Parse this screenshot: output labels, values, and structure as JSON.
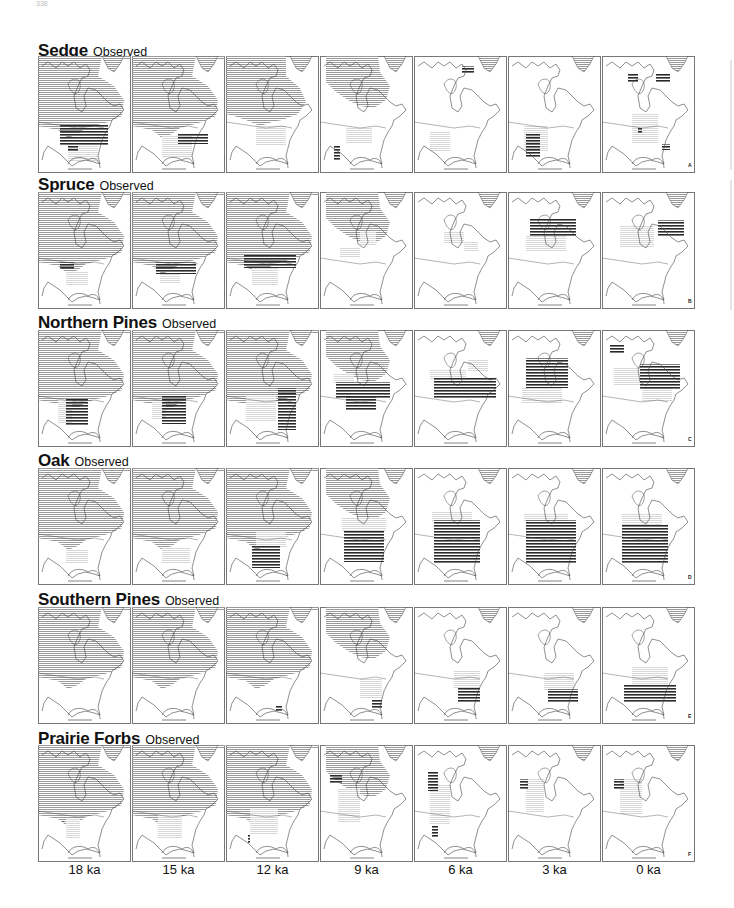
{
  "page_number": "338",
  "figure": {
    "observed_label": "Observed",
    "time_labels": [
      "18 ka",
      "15 ka",
      "12 ka",
      "9 ka",
      "6 ka",
      "3 ka",
      "0 ka"
    ],
    "colors": {
      "ice": "#9a9a9a",
      "dark": "#2a2a2a",
      "light": "#d8d8d8",
      "outline": "#444444",
      "frame": "#777777"
    },
    "rows": [
      {
        "taxon": "Sedge",
        "letter": "A",
        "panels": [
          {
            "ice": "full",
            "dark": [
              [
                22,
                68,
                48,
                22
              ],
              [
                30,
                90,
                10,
                6
              ]
            ],
            "light": [
              [
                30,
                90,
                30,
                16
              ]
            ]
          },
          {
            "ice": "full",
            "dark": [
              [
                46,
                78,
                30,
                10
              ]
            ],
            "light": [
              [
                30,
                80,
                30,
                22
              ]
            ]
          },
          {
            "ice": "mid",
            "dark": [],
            "light": [
              [
                30,
                70,
                30,
                20
              ]
            ]
          },
          {
            "ice": "small",
            "dark": [
              [
                14,
                90,
                6,
                14
              ]
            ],
            "light": [
              [
                26,
                72,
                26,
                16
              ]
            ]
          },
          {
            "ice": "none",
            "dark": [
              [
                48,
                10,
                12,
                8
              ]
            ],
            "light": [
              [
                16,
                75,
                20,
                20
              ]
            ]
          },
          {
            "ice": "none",
            "dark": [
              [
                18,
                78,
                14,
                24
              ]
            ],
            "light": [
              [
                16,
                70,
                24,
                26
              ]
            ]
          },
          {
            "ice": "none",
            "dark": [
              [
                26,
                18,
                10,
                8
              ],
              [
                54,
                18,
                14,
                8
              ],
              [
                36,
                72,
                4,
                6
              ],
              [
                60,
                88,
                8,
                6
              ]
            ],
            "light": [
              [
                30,
                58,
                26,
                30
              ]
            ]
          }
        ]
      },
      {
        "taxon": "Spruce",
        "letter": "B",
        "panels": [
          {
            "ice": "full",
            "dark": [
              [
                22,
                70,
                14,
                8
              ]
            ],
            "light": [
              [
                28,
                80,
                22,
                14
              ]
            ]
          },
          {
            "ice": "full",
            "dark": [
              [
                24,
                70,
                40,
                12
              ]
            ],
            "light": [
              [
                28,
                82,
                20,
                10
              ]
            ]
          },
          {
            "ice": "full",
            "dark": [
              [
                18,
                62,
                52,
                14
              ]
            ],
            "light": [
              [
                26,
                76,
                26,
                18
              ]
            ]
          },
          {
            "ice": "small",
            "dark": [],
            "light": [
              [
                40,
                40,
                16,
                14
              ],
              [
                20,
                55,
                20,
                10
              ]
            ]
          },
          {
            "ice": "none",
            "dark": [],
            "light": [
              [
                30,
                40,
                20,
                12
              ],
              [
                50,
                50,
                14,
                10
              ]
            ]
          },
          {
            "ice": "none",
            "dark": [
              [
                22,
                26,
                46,
                18
              ]
            ],
            "light": [
              [
                18,
                44,
                40,
                16
              ]
            ]
          },
          {
            "ice": "none",
            "dark": [
              [
                56,
                28,
                26,
                16
              ]
            ],
            "light": [
              [
                18,
                34,
                34,
                22
              ]
            ]
          }
        ]
      },
      {
        "taxon": "Northern Pines",
        "letter": "C",
        "panels": [
          {
            "ice": "full",
            "dark": [
              [
                28,
                68,
                22,
                28
              ]
            ],
            "light": [
              [
                20,
                70,
                14,
                24
              ]
            ]
          },
          {
            "ice": "full",
            "dark": [
              [
                30,
                66,
                24,
                28
              ]
            ],
            "light": [
              [
                20,
                72,
                14,
                18
              ]
            ]
          },
          {
            "ice": "full",
            "dark": [
              [
                52,
                58,
                18,
                42
              ]
            ],
            "light": [
              [
                20,
                66,
                30,
                26
              ]
            ]
          },
          {
            "ice": "small",
            "dark": [
              [
                16,
                52,
                54,
                16
              ],
              [
                26,
                66,
                30,
                14
              ]
            ],
            "light": [
              [
                14,
                44,
                20,
                10
              ]
            ]
          },
          {
            "ice": "none",
            "dark": [
              [
                20,
                48,
                62,
                20
              ]
            ],
            "light": [
              [
                16,
                40,
                36,
                10
              ],
              [
                54,
                30,
                20,
                12
              ]
            ]
          },
          {
            "ice": "none",
            "dark": [
              [
                18,
                28,
                42,
                30
              ]
            ],
            "light": [
              [
                14,
                58,
                40,
                16
              ]
            ]
          },
          {
            "ice": "none",
            "dark": [
              [
                38,
                34,
                40,
                26
              ],
              [
                8,
                14,
                14,
                10
              ]
            ],
            "light": [
              [
                12,
                38,
                26,
                18
              ],
              [
                40,
                58,
                30,
                14
              ]
            ]
          }
        ]
      },
      {
        "taxon": "Oak",
        "letter": "D",
        "panels": [
          {
            "ice": "full",
            "dark": [],
            "light": [
              [
                28,
                82,
                22,
                14
              ]
            ]
          },
          {
            "ice": "full",
            "dark": [],
            "light": [
              [
                30,
                80,
                28,
                16
              ]
            ]
          },
          {
            "ice": "full",
            "dark": [
              [
                26,
                78,
                28,
                22
              ]
            ],
            "light": [
              [
                30,
                64,
                30,
                16
              ]
            ]
          },
          {
            "ice": "small",
            "dark": [
              [
                24,
                62,
                40,
                32
              ]
            ],
            "light": [
              [
                22,
                50,
                44,
                14
              ]
            ]
          },
          {
            "ice": "none",
            "dark": [
              [
                20,
                52,
                46,
                44
              ]
            ],
            "light": [
              [
                18,
                44,
                40,
                10
              ]
            ]
          },
          {
            "ice": "none",
            "dark": [
              [
                18,
                52,
                50,
                44
              ]
            ],
            "light": [
              [
                16,
                46,
                44,
                8
              ]
            ]
          },
          {
            "ice": "none",
            "dark": [
              [
                20,
                56,
                46,
                40
              ]
            ],
            "light": [
              [
                20,
                46,
                40,
                12
              ]
            ]
          }
        ]
      },
      {
        "taxon": "Southern Pines",
        "letter": "E",
        "panels": [
          {
            "ice": "full",
            "dark": [],
            "light": []
          },
          {
            "ice": "full",
            "dark": [],
            "light": []
          },
          {
            "ice": "full",
            "dark": [
              [
                50,
                98,
                6,
                6
              ]
            ],
            "light": []
          },
          {
            "ice": "small",
            "dark": [
              [
                52,
                92,
                10,
                10
              ]
            ],
            "light": [
              [
                40,
                72,
                22,
                20
              ]
            ]
          },
          {
            "ice": "none",
            "dark": [
              [
                44,
                80,
                22,
                16
              ]
            ],
            "light": [
              [
                40,
                64,
                26,
                18
              ]
            ]
          },
          {
            "ice": "none",
            "dark": [
              [
                40,
                82,
                30,
                14
              ]
            ],
            "light": [
              [
                36,
                66,
                30,
                18
              ]
            ]
          },
          {
            "ice": "none",
            "dark": [
              [
                22,
                78,
                52,
                18
              ]
            ],
            "light": [
              [
                30,
                60,
                36,
                18
              ]
            ]
          }
        ]
      },
      {
        "taxon": "Prairie Forbs",
        "letter": "F",
        "panels": [
          {
            "ice": "full",
            "dark": [
              [
                24,
                76,
                2,
                2
              ]
            ],
            "light": [
              [
                28,
                74,
                14,
                20
              ]
            ]
          },
          {
            "ice": "full",
            "dark": [],
            "light": [
              [
                26,
                70,
                24,
                24
              ]
            ]
          },
          {
            "ice": "full",
            "dark": [
              [
                22,
                90,
                2,
                8
              ]
            ],
            "light": [
              [
                24,
                64,
                28,
                26
              ]
            ]
          },
          {
            "ice": "small",
            "dark": [
              [
                10,
                30,
                12,
                8
              ]
            ],
            "light": [
              [
                18,
                44,
                22,
                34
              ]
            ]
          },
          {
            "ice": "none",
            "dark": [
              [
                14,
                26,
                10,
                20
              ],
              [
                18,
                80,
                6,
                12
              ]
            ],
            "light": [
              [
                16,
                40,
                20,
                40
              ]
            ]
          },
          {
            "ice": "none",
            "dark": [
              [
                12,
                34,
                8,
                10
              ]
            ],
            "light": [
              [
                18,
                34,
                18,
                34
              ]
            ]
          },
          {
            "ice": "none",
            "dark": [
              [
                12,
                34,
                10,
                10
              ]
            ],
            "light": [
              [
                18,
                34,
                22,
                36
              ]
            ]
          }
        ]
      }
    ]
  }
}
